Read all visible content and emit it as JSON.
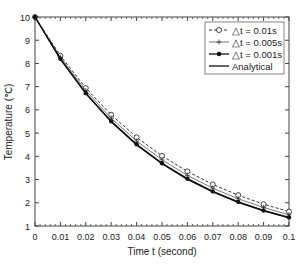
{
  "chart_data": {
    "type": "line",
    "title": "",
    "xlabel": "Time t (second)",
    "ylabel": "Temperature (℃)",
    "xlim": [
      0,
      0.1
    ],
    "ylim": [
      1,
      10
    ],
    "x_ticks": [
      "0",
      "0.01",
      "0.02",
      "0.03",
      "0.04",
      "0.05",
      "0.06",
      "0.07",
      "0.08",
      "0.09",
      "0.1"
    ],
    "y_ticks": [
      "1",
      "2",
      "3",
      "4",
      "5",
      "6",
      "7",
      "8",
      "9",
      "10"
    ],
    "grid": false,
    "legend_position": "upper right",
    "x": [
      0,
      0.01,
      0.02,
      0.03,
      0.04,
      0.05,
      0.06,
      0.07,
      0.08,
      0.09,
      0.1
    ],
    "series": [
      {
        "name": "△t = 0.01s",
        "style": "dashed",
        "marker": "open-circle",
        "values": [
          10,
          8.33,
          6.94,
          5.79,
          4.82,
          4.02,
          3.35,
          2.79,
          2.33,
          1.94,
          1.62
        ]
      },
      {
        "name": "△t = 0.005s",
        "style": "solid-thin",
        "marker": "plus",
        "values": [
          10,
          8.26,
          6.83,
          5.64,
          4.66,
          3.85,
          3.18,
          2.63,
          2.17,
          1.8,
          1.48
        ]
      },
      {
        "name": "△t = 0.001s",
        "style": "solid",
        "marker": "filled-circle",
        "values": [
          10,
          8.2,
          6.72,
          5.51,
          4.52,
          3.7,
          3.04,
          2.49,
          2.04,
          1.67,
          1.37
        ]
      },
      {
        "name": "Analytical",
        "style": "solid",
        "marker": "none",
        "values": [
          10,
          8.19,
          6.7,
          5.49,
          4.49,
          3.68,
          3.01,
          2.47,
          2.02,
          1.65,
          1.35
        ]
      }
    ]
  }
}
